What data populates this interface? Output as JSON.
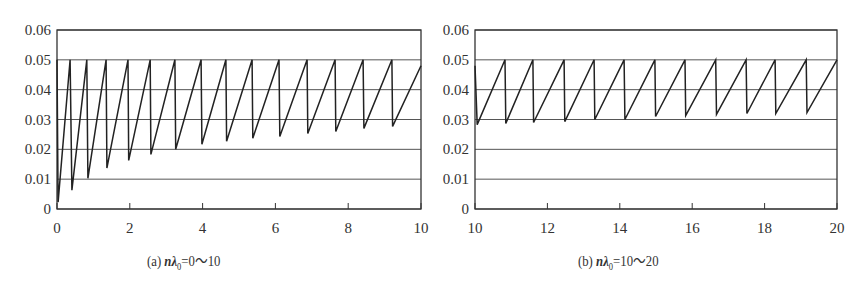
{
  "chart_data": [
    {
      "type": "line",
      "id": "a",
      "caption": {
        "prefix": "(a)",
        "var": "n",
        "lambda": "λ",
        "sub": "0",
        "range": "=0〜10"
      },
      "xlabel": "nλ0",
      "ylabel": "",
      "xlim": [
        0,
        10
      ],
      "ylim": [
        0,
        0.06
      ],
      "xticks": [
        0,
        2,
        4,
        6,
        8,
        10
      ],
      "xtick_labels": [
        "0",
        "2",
        "4",
        "6",
        "8",
        "10"
      ],
      "yticks": [
        0,
        0.01,
        0.02,
        0.03,
        0.04,
        0.05,
        0.06
      ],
      "ytick_labels": [
        "0",
        "0.01",
        "0.02",
        "0.03",
        "0.04",
        "0.05",
        "0.06"
      ],
      "grid": "horizontal",
      "legend": null,
      "series": [
        {
          "name": "sawtooth",
          "points": [
            [
              0.0,
              0.05
            ],
            [
              0.03,
              0.0023
            ],
            [
              0.36,
              0.05
            ],
            [
              0.41,
              0.0063
            ],
            [
              0.82,
              0.05
            ],
            [
              0.85,
              0.0103
            ],
            [
              1.35,
              0.05
            ],
            [
              1.37,
              0.0137
            ],
            [
              1.95,
              0.05
            ],
            [
              1.97,
              0.0163
            ],
            [
              2.56,
              0.05
            ],
            [
              2.58,
              0.0183
            ],
            [
              3.24,
              0.05
            ],
            [
              3.26,
              0.02
            ],
            [
              3.96,
              0.05
            ],
            [
              3.98,
              0.0217
            ],
            [
              4.64,
              0.05
            ],
            [
              4.66,
              0.0227
            ],
            [
              5.36,
              0.05
            ],
            [
              5.38,
              0.0237
            ],
            [
              6.1,
              0.05
            ],
            [
              6.12,
              0.0243
            ],
            [
              6.87,
              0.05
            ],
            [
              6.89,
              0.0253
            ],
            [
              7.64,
              0.05
            ],
            [
              7.66,
              0.026
            ],
            [
              8.41,
              0.05
            ],
            [
              8.43,
              0.027
            ],
            [
              9.2,
              0.05
            ],
            [
              9.22,
              0.0277
            ],
            [
              10.0,
              0.048
            ]
          ]
        }
      ]
    },
    {
      "type": "line",
      "id": "b",
      "caption": {
        "prefix": "(b)",
        "var": "n",
        "lambda": "λ",
        "sub": "0",
        "range": "=10〜20"
      },
      "xlabel": "nλ0",
      "ylabel": "",
      "xlim": [
        10,
        20
      ],
      "ylim": [
        0,
        0.06
      ],
      "xticks": [
        10,
        12,
        14,
        16,
        18,
        20
      ],
      "xtick_labels": [
        "10",
        "12",
        "14",
        "16",
        "18",
        "20"
      ],
      "yticks": [
        0,
        0.01,
        0.02,
        0.03,
        0.04,
        0.05,
        0.06
      ],
      "ytick_labels": [
        "0",
        "0.01",
        "0.02",
        "0.03",
        "0.04",
        "0.05",
        "0.06"
      ],
      "grid": "horizontal",
      "legend": null,
      "series": [
        {
          "name": "sawtooth",
          "points": [
            [
              10.0,
              0.048
            ],
            [
              10.06,
              0.0283
            ],
            [
              10.83,
              0.05
            ],
            [
              10.85,
              0.0287
            ],
            [
              11.6,
              0.05
            ],
            [
              11.62,
              0.029
            ],
            [
              12.46,
              0.05
            ],
            [
              12.48,
              0.0293
            ],
            [
              13.29,
              0.05
            ],
            [
              13.31,
              0.03
            ],
            [
              14.12,
              0.05
            ],
            [
              14.14,
              0.03
            ],
            [
              14.97,
              0.05
            ],
            [
              14.99,
              0.031
            ],
            [
              15.8,
              0.05
            ],
            [
              15.82,
              0.0313
            ],
            [
              16.65,
              0.05
            ],
            [
              16.67,
              0.0317
            ],
            [
              17.49,
              0.05
            ],
            [
              17.51,
              0.032
            ],
            [
              18.29,
              0.05
            ],
            [
              18.31,
              0.032
            ],
            [
              19.15,
              0.05
            ],
            [
              19.17,
              0.0323
            ],
            [
              20.0,
              0.05
            ]
          ]
        }
      ]
    }
  ],
  "layout": {
    "panels": [
      {
        "left": 57,
        "right": 421,
        "top": 30,
        "bottom": 209
      },
      {
        "left": 475,
        "right": 837,
        "top": 30,
        "bottom": 209
      }
    ],
    "line_color": "#222222",
    "grid_color": "#555555",
    "text_color": "#333333"
  },
  "figure_caption_partial": "(cut off at bottom edge)"
}
